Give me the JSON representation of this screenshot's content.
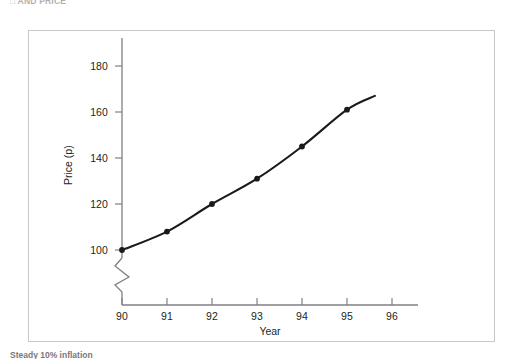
{
  "page": {
    "top_heading_partial": "□ AND PRICE",
    "bottom_caption_partial": "Steady 10% inflation"
  },
  "chart_data": {
    "type": "line",
    "title": "",
    "subtitle": "",
    "xlabel": "Year",
    "ylabel": "Price (p)",
    "x": [
      90,
      91,
      92,
      93,
      94,
      95
    ],
    "values": [
      100,
      108,
      120,
      131,
      145,
      161
    ],
    "series": [
      {
        "name": "Price",
        "x": [
          90,
          91,
          92,
          93,
          94,
          95
        ],
        "values": [
          100,
          108,
          120,
          131,
          145,
          161
        ],
        "marker": "filled-circle",
        "color": "#1a1a1a",
        "line_width": 2.1,
        "extends_beyond_last_point": true,
        "extension_end": {
          "x": 95.62,
          "y": 167
        }
      }
    ],
    "xticks": [
      90,
      91,
      92,
      93,
      94,
      95,
      96
    ],
    "xtick_labels": [
      "90",
      "91",
      "92",
      "93",
      "94",
      "95",
      "96"
    ],
    "yticks": [
      100,
      120,
      140,
      160,
      180
    ],
    "ytick_labels": [
      "100",
      "120",
      "140",
      "160",
      "180"
    ],
    "xlim": [
      90,
      96
    ],
    "ylim": [
      100,
      180
    ],
    "grid": false,
    "legend": null,
    "legend_position": "none",
    "y_axis_break": true,
    "y_axis_break_note": "zigzag break symbol on y-axis below the 100 gridline",
    "annotations": [],
    "axis_color": "#808083",
    "text_color": "#231f20",
    "frame_color": "#c9c9cb",
    "background": "#ffffff"
  }
}
